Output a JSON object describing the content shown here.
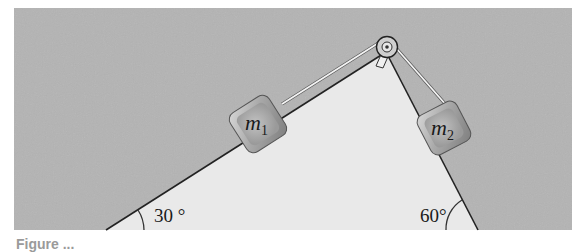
{
  "figure": {
    "colors": {
      "background_panel": "#b4b4b4",
      "wedge": "#e9e9e9",
      "outline": "#222222",
      "block": "#9f9f9f",
      "string": "#f2f2f2"
    },
    "blocks": [
      {
        "id": "m1",
        "label": "m",
        "subscript": "1"
      },
      {
        "id": "m2",
        "label": "m",
        "subscript": "2"
      }
    ],
    "angles": {
      "left": "30 °",
      "right": "60°"
    },
    "pulley": {
      "icon": "pulley-icon"
    },
    "caption": "Figure ..."
  }
}
